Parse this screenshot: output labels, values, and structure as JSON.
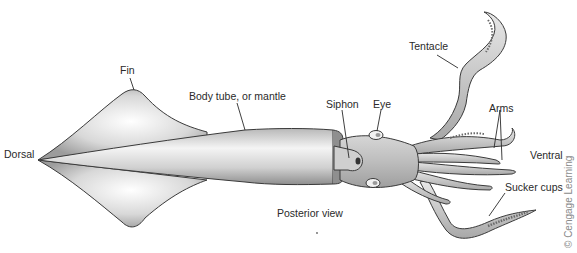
{
  "diagram": {
    "view_caption": "Posterior view",
    "credit": "© Cengage Learning",
    "labels": {
      "fin": "Fin",
      "body_tube": "Body tube, or mantle",
      "dorsal": "Dorsal",
      "siphon": "Siphon",
      "eye": "Eye",
      "tentacle": "Tentacle",
      "arms": "Arms",
      "ventral": "Ventral",
      "sucker_cups": "Sucker cups"
    },
    "colors": {
      "outline": "#3a3a3a",
      "body_light": "#f2f2f2",
      "body_dark": "#9a9a9a",
      "text": "#2a2a2a",
      "credit": "#8a8a8a"
    }
  }
}
